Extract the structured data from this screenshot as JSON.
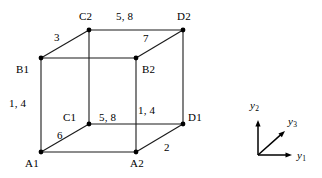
{
  "figure": {
    "type": "cube-diagram",
    "stroke_color": "#1a1a1a",
    "vertex_color": "#000000",
    "background_color": "#ffffff"
  },
  "vertices": [
    {
      "id": "A1",
      "label": "A1",
      "x": 41,
      "y": 152,
      "label_x": 25,
      "label_y": 158
    },
    {
      "id": "A2",
      "label": "A2",
      "x": 136,
      "y": 152,
      "label_x": 130,
      "label_y": 158
    },
    {
      "id": "B1",
      "label": "B1",
      "x": 41,
      "y": 58,
      "label_x": 16,
      "label_y": 64
    },
    {
      "id": "B2",
      "label": "B2",
      "x": 136,
      "y": 58,
      "label_x": 142,
      "label_y": 64
    },
    {
      "id": "C1",
      "label": "C1",
      "x": 89,
      "y": 124,
      "label_x": 63,
      "label_y": 112
    },
    {
      "id": "C2",
      "label": "C2",
      "x": 89,
      "y": 30,
      "label_x": 79,
      "label_y": 11
    },
    {
      "id": "D1",
      "label": "D1",
      "x": 183,
      "y": 124,
      "label_x": 188,
      "label_y": 112
    },
    {
      "id": "D2",
      "label": "D2",
      "x": 183,
      "y": 30,
      "label_x": 177,
      "label_y": 11
    }
  ],
  "edges": [
    {
      "from": "A1",
      "to": "A2"
    },
    {
      "from": "A1",
      "to": "B1"
    },
    {
      "from": "A1",
      "to": "C1"
    },
    {
      "from": "A2",
      "to": "B2"
    },
    {
      "from": "A2",
      "to": "D1"
    },
    {
      "from": "B1",
      "to": "B2"
    },
    {
      "from": "B1",
      "to": "C2"
    },
    {
      "from": "B2",
      "to": "D2"
    },
    {
      "from": "C1",
      "to": "C2"
    },
    {
      "from": "C1",
      "to": "D1"
    },
    {
      "from": "C2",
      "to": "D2"
    },
    {
      "from": "D1",
      "to": "D2"
    }
  ],
  "edge_labels": [
    {
      "id": "edge-label-b1-c2",
      "text": "3",
      "x": 54,
      "y": 32,
      "edge": "B1-C2"
    },
    {
      "id": "edge-label-c2-d2",
      "text": "5, 8",
      "x": 116,
      "y": 11,
      "edge": "C2-D2"
    },
    {
      "id": "edge-label-b2-d2",
      "text": "7",
      "x": 143,
      "y": 33,
      "edge": "B2-D2"
    },
    {
      "id": "edge-label-a1-b1",
      "text": "1, 4",
      "x": 9,
      "y": 98,
      "edge": "A1-B1"
    },
    {
      "id": "edge-label-c1-d1",
      "text": "5, 8",
      "x": 99,
      "y": 112,
      "edge": "C1-D1"
    },
    {
      "id": "edge-label-a2-b2",
      "text": "1, 4",
      "x": 138,
      "y": 105,
      "edge": "A2-B2"
    },
    {
      "id": "edge-label-a1-c1",
      "text": "6",
      "x": 57,
      "y": 130,
      "edge": "A1-C1"
    },
    {
      "id": "edge-label-a2-d1",
      "text": "2",
      "x": 164,
      "y": 142,
      "edge": "A2-D1"
    }
  ],
  "axes": {
    "origin": {
      "x": 258,
      "y": 155
    },
    "items": [
      {
        "id": "y1",
        "base": "y",
        "sub": "1",
        "tip_x": 292,
        "tip_y": 155,
        "label_x": 297,
        "label_y": 150
      },
      {
        "id": "y2",
        "base": "y",
        "sub": "2",
        "tip_x": 258,
        "tip_y": 120,
        "label_x": 250,
        "label_y": 100
      },
      {
        "id": "y3",
        "base": "y",
        "sub": "3",
        "tip_x": 285,
        "tip_y": 131,
        "label_x": 288,
        "label_y": 116
      }
    ]
  }
}
